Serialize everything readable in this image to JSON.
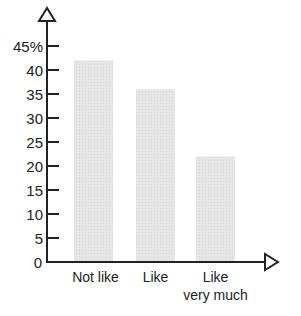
{
  "chart_data": {
    "type": "bar",
    "title": "",
    "xlabel": "",
    "ylabel": "",
    "categories": [
      "Not like",
      "Like",
      "Like\nvery much"
    ],
    "category_lines": [
      [
        "Not like"
      ],
      [
        "Like"
      ],
      [
        "Like",
        "very much"
      ]
    ],
    "values": [
      42,
      36,
      22
    ],
    "unit": "%",
    "ylim": [
      0,
      45
    ],
    "yticks": [
      0,
      5,
      10,
      15,
      20,
      25,
      30,
      35,
      40,
      45
    ],
    "ytick_labels": [
      "0",
      "5",
      "10",
      "15",
      "20",
      "25",
      "30",
      "35",
      "40",
      "45%"
    ],
    "grid": false,
    "legend": null,
    "axes_arrows": true
  },
  "colors": {
    "bar": "#e4e4e4",
    "axis": "#222222",
    "text": "#222222"
  }
}
